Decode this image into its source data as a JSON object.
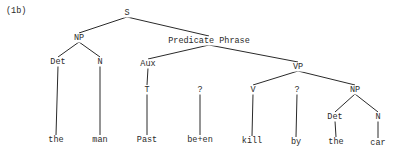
{
  "example_label": "(1b)",
  "nodes": {
    "S": {
      "label": "S",
      "x": 127,
      "y": 13
    },
    "NP1": {
      "label": "NP",
      "x": 79,
      "y": 38
    },
    "PredP": {
      "label": "Predicate Phrase",
      "x": 209,
      "y": 41
    },
    "Det1": {
      "label": "Det",
      "x": 58,
      "y": 62
    },
    "N1": {
      "label": "N",
      "x": 100,
      "y": 62
    },
    "Aux": {
      "label": "Aux",
      "x": 148,
      "y": 64
    },
    "VP": {
      "label": "VP",
      "x": 298,
      "y": 67
    },
    "T": {
      "label": "T",
      "x": 147,
      "y": 90
    },
    "Q1": {
      "label": "?",
      "x": 200,
      "y": 90
    },
    "V": {
      "label": "V",
      "x": 253,
      "y": 90
    },
    "Q2": {
      "label": "?",
      "x": 297,
      "y": 90
    },
    "NP2": {
      "label": "NP",
      "x": 355,
      "y": 90
    },
    "Det2": {
      "label": "Det",
      "x": 335,
      "y": 117
    },
    "N2": {
      "label": "N",
      "x": 378,
      "y": 117
    },
    "w_the1": {
      "label": "the",
      "x": 56,
      "y": 140
    },
    "w_man": {
      "label": "man",
      "x": 100,
      "y": 140
    },
    "w_past": {
      "label": "Past",
      "x": 147,
      "y": 140
    },
    "w_been": {
      "label": "be+en",
      "x": 200,
      "y": 140
    },
    "w_kill": {
      "label": "kill",
      "x": 252,
      "y": 141
    },
    "w_by": {
      "label": "by",
      "x": 296,
      "y": 142
    },
    "w_the2": {
      "label": "the",
      "x": 336,
      "y": 142
    },
    "w_car": {
      "label": "car",
      "x": 378,
      "y": 143
    }
  },
  "edges": [
    [
      "S",
      "NP1"
    ],
    [
      "S",
      "PredP"
    ],
    [
      "NP1",
      "Det1"
    ],
    [
      "NP1",
      "N1"
    ],
    [
      "PredP",
      "Aux"
    ],
    [
      "PredP",
      "VP"
    ],
    [
      "Det1",
      "w_the1"
    ],
    [
      "N1",
      "w_man"
    ],
    [
      "Aux",
      "T"
    ],
    [
      "T",
      "w_past"
    ],
    [
      "Q1",
      "w_been"
    ],
    [
      "VP",
      "V"
    ],
    [
      "VP",
      "NP2"
    ],
    [
      "V",
      "w_kill"
    ],
    [
      "Q2",
      "w_by"
    ],
    [
      "NP2",
      "Det2"
    ],
    [
      "NP2",
      "N2"
    ],
    [
      "Det2",
      "w_the2"
    ],
    [
      "N2",
      "w_car"
    ]
  ]
}
